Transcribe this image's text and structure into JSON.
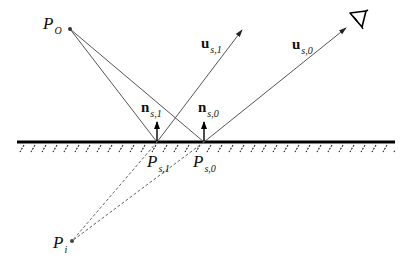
{
  "diagram": {
    "type": "reflection-geometry",
    "points": {
      "P_o": {
        "label": "P",
        "sub": "O",
        "x": 70,
        "y": 29
      },
      "P_i": {
        "label": "P",
        "sub": "i",
        "x": 72,
        "y": 241
      },
      "P_s1": {
        "label": "P",
        "sub": "s,1",
        "x": 157,
        "y": 142
      },
      "P_s0": {
        "label": "P",
        "sub": "s,0",
        "x": 204,
        "y": 142
      }
    },
    "vectors": {
      "n_s1": {
        "label": "n",
        "sub": "s,1"
      },
      "n_s0": {
        "label": "n",
        "sub": "s,0"
      },
      "u_s1": {
        "label": "u",
        "sub": "s,1"
      },
      "u_s0": {
        "label": "u",
        "sub": "s,0"
      }
    },
    "eye_icon": "eye-icon",
    "surface": {
      "y": 142,
      "x_start": 17,
      "x_end": 395,
      "hatched": true
    },
    "colors": {
      "line": "#555555",
      "surface": "#000000",
      "text": "#111111"
    }
  }
}
